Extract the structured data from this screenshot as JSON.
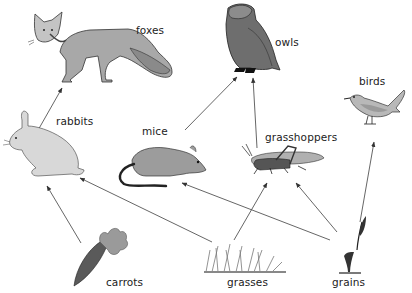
{
  "diagram": {
    "type": "food-web",
    "arrow_color": "#555555",
    "organisms": {
      "foxes": {
        "label": "foxes"
      },
      "owls": {
        "label": "owls"
      },
      "birds": {
        "label": "birds"
      },
      "rabbits": {
        "label": "rabbits"
      },
      "mice": {
        "label": "mice"
      },
      "grasshoppers": {
        "label": "grasshoppers"
      },
      "carrots": {
        "label": "carrots"
      },
      "grasses": {
        "label": "grasses"
      },
      "grains": {
        "label": "grains"
      }
    },
    "edges": [
      {
        "from": "carrots",
        "to": "rabbits"
      },
      {
        "from": "grasses",
        "to": "rabbits"
      },
      {
        "from": "grains",
        "to": "mice"
      },
      {
        "from": "grasses",
        "to": "grasshoppers"
      },
      {
        "from": "grains",
        "to": "grasshoppers"
      },
      {
        "from": "grains",
        "to": "birds"
      },
      {
        "from": "rabbits",
        "to": "foxes"
      },
      {
        "from": "mice",
        "to": "owls"
      },
      {
        "from": "grasshoppers",
        "to": "owls"
      }
    ]
  }
}
